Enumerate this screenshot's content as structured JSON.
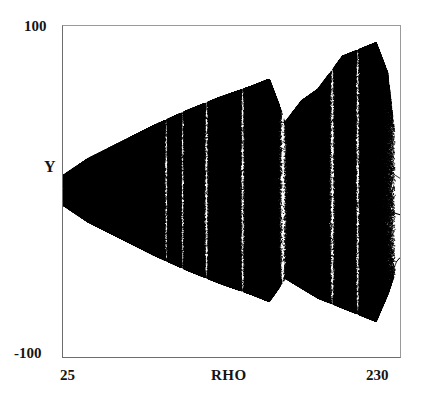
{
  "figure": {
    "title": "",
    "axes": {
      "y_label": "Y",
      "y_max_label": "100",
      "y_min_label": "-100",
      "x_label": "RHO",
      "x_min_label": "25",
      "x_max_label": "230"
    }
  },
  "chart_data": {
    "type": "scatter",
    "title": "",
    "xlabel": "RHO",
    "ylabel": "Y",
    "xlim": [
      25,
      230
    ],
    "ylim": [
      -100,
      100
    ],
    "grid": false,
    "legend": null,
    "point_color": "#000000",
    "background_color": "#ffffff",
    "series": [
      {
        "name": "attractor",
        "n_points_approx": 60000,
        "envelope_upper": [
          {
            "rho": 25,
            "y": 10
          },
          {
            "rho": 40,
            "y": 20
          },
          {
            "rho": 60,
            "y": 30
          },
          {
            "rho": 80,
            "y": 40
          },
          {
            "rho": 100,
            "y": 49
          },
          {
            "rho": 120,
            "y": 57
          },
          {
            "rho": 140,
            "y": 64
          },
          {
            "rho": 150,
            "y": 68
          },
          {
            "rho": 160,
            "y": 42
          },
          {
            "rho": 170,
            "y": 55
          },
          {
            "rho": 180,
            "y": 62
          },
          {
            "rho": 195,
            "y": 82
          },
          {
            "rho": 205,
            "y": 86
          },
          {
            "rho": 215,
            "y": 90
          },
          {
            "rho": 222,
            "y": 72
          },
          {
            "rho": 227,
            "y": 30
          },
          {
            "rho": 230,
            "y": 12
          }
        ],
        "envelope_lower": [
          {
            "rho": 25,
            "y": -8
          },
          {
            "rho": 40,
            "y": -18
          },
          {
            "rho": 60,
            "y": -28
          },
          {
            "rho": 80,
            "y": -38
          },
          {
            "rho": 100,
            "y": -47
          },
          {
            "rho": 120,
            "y": -55
          },
          {
            "rho": 140,
            "y": -62
          },
          {
            "rho": 150,
            "y": -66
          },
          {
            "rho": 160,
            "y": -52
          },
          {
            "rho": 170,
            "y": -58
          },
          {
            "rho": 180,
            "y": -64
          },
          {
            "rho": 195,
            "y": -70
          },
          {
            "rho": 205,
            "y": -74
          },
          {
            "rho": 215,
            "y": -78
          },
          {
            "rho": 222,
            "y": -62
          },
          {
            "rho": 230,
            "y": -40
          }
        ],
        "periodic_windows": [
          {
            "rho_start": 86,
            "rho_end": 89,
            "kind": "narrow-band"
          },
          {
            "rho_start": 96,
            "rho_end": 99,
            "kind": "narrow-band"
          },
          {
            "rho_start": 110,
            "rho_end": 114,
            "kind": "narrow-band"
          },
          {
            "rho_start": 132,
            "rho_end": 136,
            "kind": "narrow-band"
          },
          {
            "rho_start": 155,
            "rho_end": 162,
            "kind": "period-3"
          },
          {
            "rho_start": 186,
            "rho_end": 191,
            "kind": "narrow-band"
          },
          {
            "rho_start": 202,
            "rho_end": 206,
            "kind": "narrow-band"
          }
        ],
        "branches": [
          {
            "name": "upper-branch",
            "rho_start": 163,
            "rho_end": 192,
            "y_start": 22,
            "y_end": 46
          },
          {
            "name": "middle-branch",
            "rho_start": 163,
            "rho_end": 230,
            "y_start": 2,
            "y_end": -14
          },
          {
            "name": "lower-branch",
            "rho_start": 163,
            "rho_end": 196,
            "y_start": -30,
            "y_end": -42
          }
        ],
        "reverse_cascade": {
          "rho_start": 214,
          "rho_end": 230,
          "upper_converge_y": 8,
          "lower_bubble_center_y": -58,
          "bubble_half_width": 14
        }
      }
    ]
  }
}
